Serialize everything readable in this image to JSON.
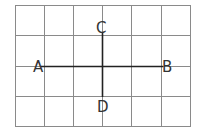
{
  "diagram": {
    "grid": {
      "cols": 6,
      "rows": 4,
      "x0": 15,
      "y0": 5,
      "x1": 190,
      "y1": 126,
      "color": "#8a8a8a"
    },
    "segments": [
      {
        "name": "AB",
        "from": "A",
        "to": "B",
        "orientation": "horizontal"
      },
      {
        "name": "CD",
        "from": "C",
        "to": "D",
        "orientation": "vertical"
      }
    ],
    "points": {
      "A": {
        "label": "A"
      },
      "B": {
        "label": "B"
      },
      "C": {
        "label": "C"
      },
      "D": {
        "label": "D"
      }
    },
    "line_color": "#222222"
  }
}
